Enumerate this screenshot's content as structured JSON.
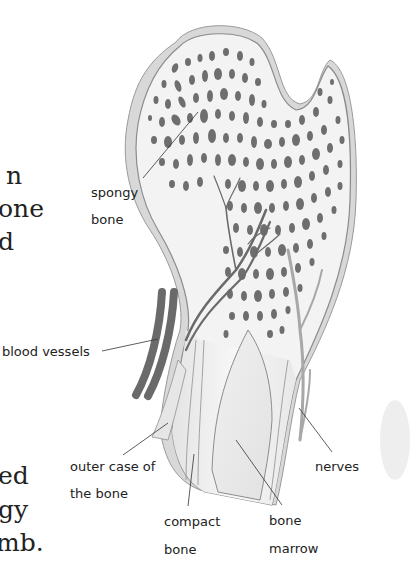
{
  "body_text_fragments": {
    "top": [
      "n",
      "one",
      "d"
    ],
    "bottom": [
      "ed",
      "gy",
      "mb."
    ]
  },
  "labels": {
    "spongy_bone": [
      "spongy",
      "bone"
    ],
    "blood_vessels": "blood vessels",
    "outer_case": [
      "outer case of",
      "the bone"
    ],
    "compact_bone": [
      "compact",
      "bone"
    ],
    "bone_marrow": [
      "bone",
      "marrow"
    ],
    "nerves": "nerves"
  },
  "colors": {
    "bone_fill": "#f2f2f2",
    "bone_outline": "#9a9a9a",
    "pores": "#6e6e6e",
    "blood_vessel": "#6a6a6a",
    "nerve": "#a8a8a8",
    "leader_line": "#333333"
  }
}
